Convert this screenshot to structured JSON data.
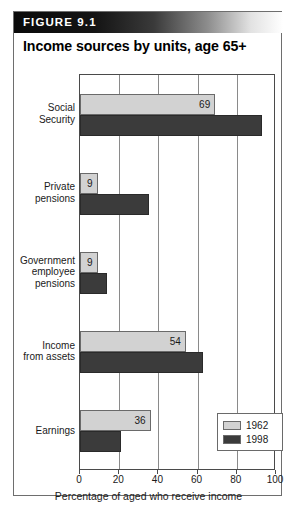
{
  "figure": {
    "header_label": "FIGURE 9.1",
    "title": "Income sources by units, age 65+"
  },
  "chart_data": {
    "type": "bar",
    "orientation": "horizontal",
    "title": "Income sources by units, age 65+",
    "xlabel": "Percentage of aged who receive income",
    "ylabel": "",
    "xlim": [
      0,
      100
    ],
    "xticks": [
      0,
      20,
      40,
      60,
      80,
      100
    ],
    "xtick_labels": [
      "0",
      "20",
      "40",
      "60",
      "80",
      "100"
    ],
    "grid": true,
    "legend_position": "bottom-right",
    "categories": [
      "Social Security",
      "Private pensions",
      "Government employee pensions",
      "Income from assets",
      "Earnings"
    ],
    "category_lines": [
      [
        "Social",
        "Security"
      ],
      [
        "Private",
        "pensions"
      ],
      [
        "Government",
        "employee",
        "pensions"
      ],
      [
        "Income",
        "from assets"
      ],
      [
        "Earnings"
      ]
    ],
    "series": [
      {
        "name": "1962",
        "color": "#d2d2d2",
        "values": [
          69,
          9,
          9,
          54,
          36
        ],
        "labels": [
          "69",
          "9",
          "9",
          "54",
          "36"
        ],
        "labels_shown": true
      },
      {
        "name": "1998",
        "color": "#3b3b3b",
        "values": [
          93,
          35,
          14,
          63,
          21
        ],
        "labels": [
          "",
          "",
          "",
          "",
          ""
        ],
        "labels_shown": false
      }
    ]
  },
  "legend": {
    "items": [
      {
        "label": "1962",
        "color": "#d2d2d2"
      },
      {
        "label": "1998",
        "color": "#3b3b3b"
      }
    ]
  },
  "colors": {
    "series_1962": "#d2d2d2",
    "series_1998": "#3b3b3b",
    "frame": "#6e6e6e",
    "grid": "#8a8a8a",
    "text": "#1a1a1a",
    "header_text": "#ffffff"
  }
}
